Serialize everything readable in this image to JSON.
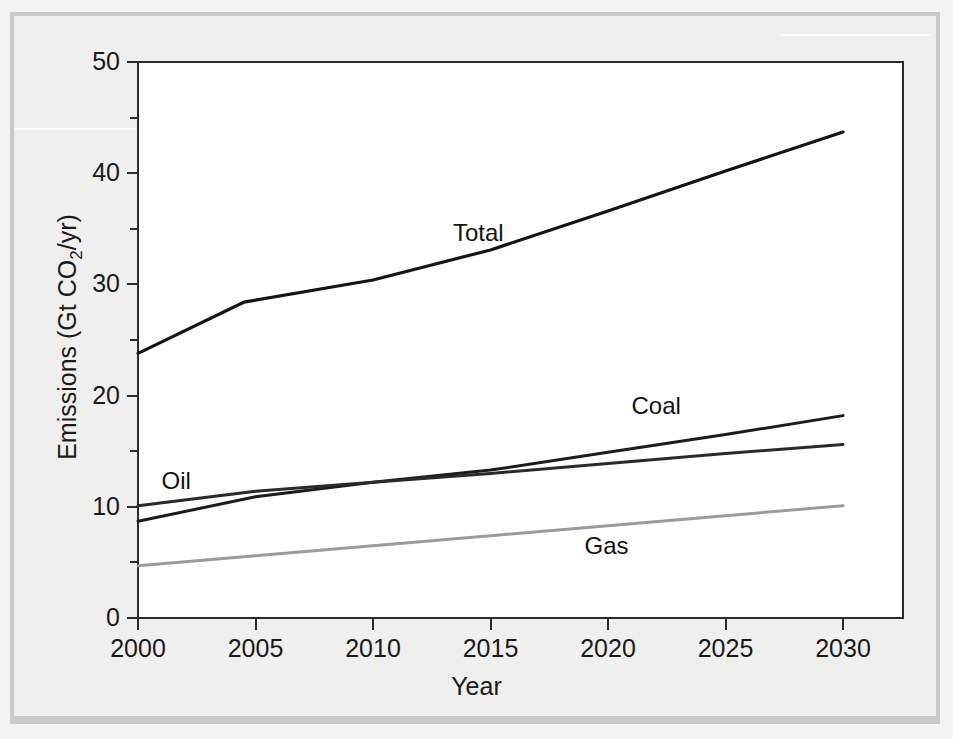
{
  "figure": {
    "background_color": "#efefed",
    "plot_background": "#ffffff",
    "axis_color": "#2b2b2b"
  },
  "chart_data": {
    "type": "line",
    "title": "",
    "xlabel": "Year",
    "ylabel": "Emissions (Gt CO2/yr)",
    "ylabel_parts": {
      "prefix": "Emissions (Gt CO",
      "sub": "2",
      "suffix": "/yr)"
    },
    "xlim": [
      2000,
      2030
    ],
    "ylim": [
      0,
      50
    ],
    "xticks": [
      2000,
      2005,
      2010,
      2015,
      2020,
      2025,
      2030
    ],
    "xtick_labels": [
      "2000",
      "2005",
      "2010",
      "2015",
      "2020",
      "2025",
      "2030"
    ],
    "yticks": [
      0,
      10,
      20,
      30,
      40,
      50
    ],
    "ytick_labels": [
      "0",
      "10",
      "20",
      "30",
      "40",
      "50"
    ],
    "yticks_minor": [
      5,
      15,
      25,
      35,
      45
    ],
    "grid": false,
    "legend": "inline-labels",
    "series": [
      {
        "name": "Total",
        "color": "#141414",
        "width": 3.2,
        "label_x": 2013.4,
        "label_y": 34.6,
        "x": [
          2000,
          2004.5,
          2010,
          2015,
          2020,
          2025,
          2030
        ],
        "y": [
          23.8,
          28.4,
          30.4,
          33.1,
          36.6,
          40.2,
          43.7
        ]
      },
      {
        "name": "Coal",
        "color": "#1c1c1c",
        "width": 3.0,
        "label_x": 2021.0,
        "label_y": 19.1,
        "x": [
          2000,
          2005,
          2010,
          2015,
          2020,
          2025,
          2030
        ],
        "y": [
          8.7,
          10.9,
          12.2,
          13.3,
          14.9,
          16.5,
          18.2
        ]
      },
      {
        "name": "Oil",
        "color": "#2a2a2a",
        "width": 3.0,
        "label_x": 2001.0,
        "label_y": 12.3,
        "x": [
          2000,
          2005,
          2010,
          2015,
          2020,
          2025,
          2030
        ],
        "y": [
          10.1,
          11.4,
          12.2,
          13.0,
          13.9,
          14.8,
          15.6
        ]
      },
      {
        "name": "Gas",
        "color": "#9a9a9a",
        "width": 3.0,
        "label_x": 2019.0,
        "label_y": 6.5,
        "x": [
          2000,
          2005,
          2010,
          2015,
          2020,
          2025,
          2030
        ],
        "y": [
          4.7,
          5.6,
          6.5,
          7.4,
          8.3,
          9.2,
          10.1
        ]
      }
    ]
  }
}
